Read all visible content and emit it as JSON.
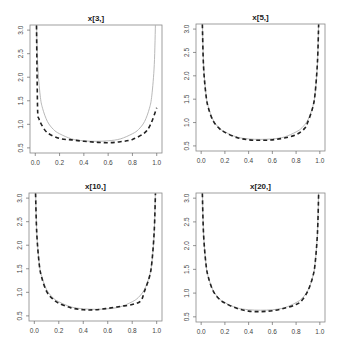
{
  "header": {
    "cropped_text": ""
  },
  "chart_data": [
    {
      "type": "line",
      "title": "x[3,]",
      "xlabel": "",
      "ylabel": "",
      "xlim": [
        0.0,
        1.0
      ],
      "ylim": [
        0.5,
        3.0
      ],
      "xticks": [
        "0.0",
        "0.2",
        "0.4",
        "0.6",
        "0.8",
        "1.0"
      ],
      "yticks": [
        "0.5",
        "1.0",
        "1.5",
        "2.0",
        "2.5",
        "3.0"
      ],
      "grid": false,
      "series": [
        {
          "name": "true density",
          "style": "solid",
          "color": "#b0b0b0",
          "x": [
            0.01,
            0.02,
            0.04,
            0.06,
            0.1,
            0.15,
            0.2,
            0.3,
            0.4,
            0.5,
            0.6,
            0.7,
            0.8,
            0.85,
            0.9,
            0.94,
            0.96,
            0.98,
            0.99
          ],
          "y": [
            3.2,
            2.27,
            1.62,
            1.34,
            1.06,
            0.89,
            0.8,
            0.69,
            0.65,
            0.64,
            0.65,
            0.69,
            0.8,
            0.89,
            1.06,
            1.34,
            1.62,
            2.27,
            3.2
          ]
        },
        {
          "name": "estimate",
          "style": "dashed",
          "color": "#222222",
          "x": [
            0.01,
            0.015,
            0.02,
            0.03,
            0.05,
            0.1,
            0.2,
            0.3,
            0.4,
            0.5,
            0.6,
            0.7,
            0.8,
            0.9,
            0.95,
            1.0
          ],
          "y": [
            3.1,
            2.0,
            1.25,
            1.12,
            1.0,
            0.82,
            0.7,
            0.67,
            0.64,
            0.62,
            0.61,
            0.63,
            0.68,
            0.82,
            1.0,
            1.35
          ]
        }
      ]
    },
    {
      "type": "line",
      "title": "x[5,]",
      "xlabel": "",
      "ylabel": "",
      "xlim": [
        0.0,
        1.0
      ],
      "ylim": [
        0.5,
        3.0
      ],
      "xticks": [
        "0.0",
        "0.2",
        "0.4",
        "0.6",
        "0.8",
        "1.0"
      ],
      "yticks": [
        "0.5",
        "1.0",
        "1.5",
        "2.0",
        "2.5",
        "3.0"
      ],
      "grid": false,
      "series": [
        {
          "name": "true density",
          "style": "solid",
          "color": "#b0b0b0",
          "x": [
            0.01,
            0.02,
            0.04,
            0.06,
            0.1,
            0.15,
            0.2,
            0.3,
            0.4,
            0.5,
            0.6,
            0.7,
            0.8,
            0.85,
            0.9,
            0.94,
            0.96,
            0.98,
            0.99
          ],
          "y": [
            3.2,
            2.27,
            1.62,
            1.34,
            1.06,
            0.89,
            0.8,
            0.69,
            0.65,
            0.64,
            0.65,
            0.69,
            0.8,
            0.89,
            1.06,
            1.34,
            1.62,
            2.27,
            3.2
          ]
        },
        {
          "name": "estimate",
          "style": "dashed",
          "color": "#222222",
          "x": [
            0.01,
            0.02,
            0.04,
            0.06,
            0.1,
            0.15,
            0.2,
            0.3,
            0.4,
            0.5,
            0.6,
            0.7,
            0.8,
            0.87,
            0.9,
            0.94,
            0.96,
            0.98,
            0.99
          ],
          "y": [
            3.1,
            2.2,
            1.6,
            1.32,
            1.04,
            0.88,
            0.79,
            0.68,
            0.63,
            0.62,
            0.63,
            0.67,
            0.74,
            0.87,
            1.02,
            1.32,
            1.62,
            2.3,
            3.1
          ]
        }
      ]
    },
    {
      "type": "line",
      "title": "x[10,]",
      "xlabel": "",
      "ylabel": "",
      "xlim": [
        0.0,
        1.0
      ],
      "ylim": [
        0.5,
        3.0
      ],
      "xticks": [
        "0.0",
        "0.2",
        "0.4",
        "0.6",
        "0.8",
        "1.0"
      ],
      "yticks": [
        "0.5",
        "1.0",
        "1.5",
        "2.0",
        "2.5",
        "3.0"
      ],
      "grid": false,
      "series": [
        {
          "name": "true density",
          "style": "solid",
          "color": "#b0b0b0",
          "x": [
            0.01,
            0.02,
            0.04,
            0.06,
            0.1,
            0.15,
            0.2,
            0.3,
            0.4,
            0.5,
            0.6,
            0.7,
            0.8,
            0.85,
            0.9,
            0.94,
            0.96,
            0.98,
            0.99
          ],
          "y": [
            3.2,
            2.27,
            1.62,
            1.34,
            1.06,
            0.89,
            0.8,
            0.69,
            0.65,
            0.64,
            0.65,
            0.69,
            0.8,
            0.89,
            1.06,
            1.34,
            1.62,
            2.27,
            3.2
          ]
        },
        {
          "name": "estimate",
          "style": "dashed",
          "color": "#222222",
          "x": [
            0.01,
            0.02,
            0.04,
            0.06,
            0.1,
            0.15,
            0.2,
            0.3,
            0.4,
            0.5,
            0.6,
            0.7,
            0.8,
            0.87,
            0.9,
            0.94,
            0.96,
            0.98,
            0.99
          ],
          "y": [
            3.1,
            2.25,
            1.6,
            1.32,
            1.02,
            0.86,
            0.77,
            0.67,
            0.63,
            0.63,
            0.66,
            0.7,
            0.74,
            0.82,
            1.02,
            1.32,
            1.62,
            2.3,
            3.1
          ]
        }
      ]
    },
    {
      "type": "line",
      "title": "x[20,]",
      "xlabel": "",
      "ylabel": "",
      "xlim": [
        0.0,
        1.0
      ],
      "ylim": [
        0.5,
        3.0
      ],
      "xticks": [
        "0.0",
        "0.2",
        "0.4",
        "0.6",
        "0.8",
        "1.0"
      ],
      "yticks": [
        "0.5",
        "1.0",
        "1.5",
        "2.0",
        "2.5",
        "3.0"
      ],
      "grid": false,
      "series": [
        {
          "name": "true density",
          "style": "solid",
          "color": "#b0b0b0",
          "x": [
            0.01,
            0.02,
            0.04,
            0.06,
            0.1,
            0.15,
            0.2,
            0.3,
            0.4,
            0.5,
            0.6,
            0.7,
            0.8,
            0.85,
            0.9,
            0.94,
            0.96,
            0.98,
            0.99
          ],
          "y": [
            3.2,
            2.27,
            1.62,
            1.34,
            1.06,
            0.89,
            0.8,
            0.69,
            0.65,
            0.64,
            0.65,
            0.69,
            0.8,
            0.89,
            1.06,
            1.34,
            1.62,
            2.27,
            3.2
          ]
        },
        {
          "name": "estimate",
          "style": "dashed",
          "color": "#222222",
          "x": [
            0.01,
            0.02,
            0.04,
            0.06,
            0.1,
            0.15,
            0.2,
            0.3,
            0.4,
            0.5,
            0.6,
            0.7,
            0.8,
            0.85,
            0.9,
            0.94,
            0.96,
            0.98,
            0.99
          ],
          "y": [
            3.1,
            2.25,
            1.62,
            1.34,
            1.05,
            0.88,
            0.79,
            0.68,
            0.62,
            0.61,
            0.63,
            0.68,
            0.76,
            0.85,
            1.05,
            1.34,
            1.62,
            2.27,
            3.1
          ]
        }
      ]
    }
  ]
}
